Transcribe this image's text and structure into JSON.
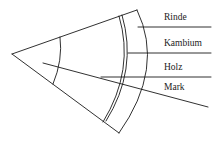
{
  "diagram": {
    "labels": {
      "rinde": "Rinde",
      "kambium": "Kambium",
      "holz": "Holz",
      "mark": "Mark"
    },
    "colors": {
      "line": "#1a1a1a",
      "text": "#222222",
      "background": "#ffffff"
    }
  }
}
